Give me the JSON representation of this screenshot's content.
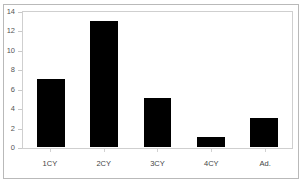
{
  "figure": {
    "caption_sliver": "",
    "background_color": "#ffffff",
    "bar_color": "#000000",
    "frame_color": "#b9b9b9",
    "plot_frame_color": "#cfcfcf"
  },
  "chart_data": {
    "type": "bar",
    "title": "",
    "xlabel": "",
    "ylabel": "",
    "categories": [
      "1CY",
      "2CY",
      "3CY",
      "4CY",
      "Ad."
    ],
    "values": [
      7,
      13,
      5,
      1,
      3
    ],
    "ylim": [
      0,
      14
    ],
    "yticks": [
      0,
      2,
      4,
      6,
      8,
      10,
      12,
      14
    ],
    "ytick_labels": [
      "0",
      "2",
      "4",
      "6",
      "8",
      "10",
      "12",
      "14"
    ],
    "grid": false,
    "legend": false,
    "series_color": "#000000"
  }
}
